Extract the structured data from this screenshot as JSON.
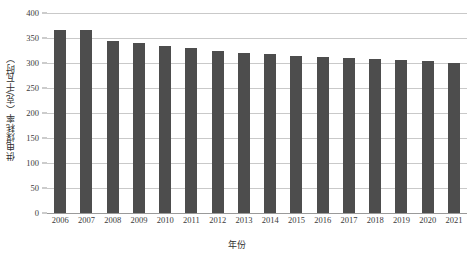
{
  "chart_data": {
    "type": "bar",
    "title": "",
    "subtitle": "",
    "xlabel": "年份",
    "ylabel": "供电煤耗率（克/千瓦时）",
    "categories": [
      "2006",
      "2007",
      "2008",
      "2009",
      "2010",
      "2011",
      "2012",
      "2013",
      "2014",
      "2015",
      "2016",
      "2017",
      "2018",
      "2019",
      "2020",
      "2021"
    ],
    "values": [
      367,
      366,
      345,
      340,
      335,
      330,
      325,
      321,
      318,
      315,
      312,
      310,
      308,
      307,
      305,
      301
    ],
    "series": [
      {
        "name": "供电煤耗率",
        "values": [
          367,
          366,
          345,
          340,
          335,
          330,
          325,
          321,
          318,
          315,
          312,
          310,
          308,
          307,
          305,
          301
        ]
      }
    ],
    "ylim": [
      0,
      400
    ],
    "ytick_values": [
      0,
      50,
      100,
      150,
      200,
      250,
      300,
      350,
      400
    ],
    "ytick_labels": [
      "0",
      "50",
      "100",
      "150",
      "200",
      "250",
      "300",
      "350",
      "400"
    ],
    "grid": true,
    "grid_axis": "y",
    "legend": false,
    "legend_position": "none",
    "bar_color": "#4d4d4d",
    "grid_color": "#c9c9c9",
    "axis_color": "#9a9a9a",
    "background_color": "#ffffff",
    "text_color": "#3b3b3b"
  },
  "axes": {
    "y_title": "供电煤耗率（克/千瓦时）",
    "x_title": "年份"
  }
}
